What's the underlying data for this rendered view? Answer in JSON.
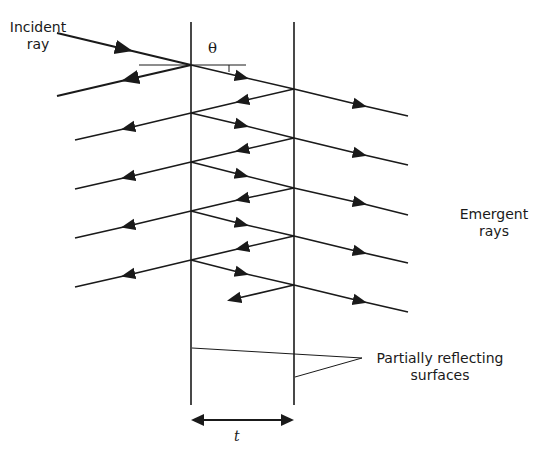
{
  "diagram": {
    "type": "multiple-beam interference (Fabry-Perot etalon) ray diagram",
    "labels": {
      "incident_line1": "Incident",
      "incident_line2": "ray",
      "angle": "θ",
      "emergent_line1": "Emergent",
      "emergent_line2": "rays",
      "surfaces_line1": "Partially reflecting",
      "surfaces_line2": "surfaces",
      "thickness": "t"
    },
    "colors": {
      "line": "#1a1a1a",
      "background": "#ffffff"
    },
    "surfaces": [
      {
        "name": "left",
        "x": 191,
        "y_top": 22,
        "y_bottom": 405
      },
      {
        "name": "right",
        "x": 294,
        "y_top": 22,
        "y_bottom": 405
      }
    ],
    "emergent_ray_count": 5,
    "reflected_ray_count": 5
  }
}
